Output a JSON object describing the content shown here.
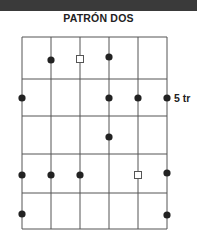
{
  "title": "PATRÓN DOS",
  "fret_label": "5 tr",
  "colors": {
    "line": "#555555",
    "dot": "#222222",
    "band": "#3a3a3a"
  },
  "grid": {
    "x": [
      22,
      51,
      80,
      109,
      138,
      167
    ],
    "y": [
      37,
      79,
      116,
      154,
      193,
      229
    ]
  },
  "markers": [
    {
      "type": "dot",
      "x": 51,
      "y": 60
    },
    {
      "type": "square",
      "x": 80,
      "y": 59
    },
    {
      "type": "dot",
      "x": 109,
      "y": 57
    },
    {
      "type": "dot",
      "x": 22,
      "y": 98
    },
    {
      "type": "dot",
      "x": 109,
      "y": 98
    },
    {
      "type": "dot",
      "x": 138,
      "y": 98
    },
    {
      "type": "dot",
      "x": 167,
      "y": 98
    },
    {
      "type": "dot",
      "x": 109,
      "y": 137
    },
    {
      "type": "dot",
      "x": 22,
      "y": 175
    },
    {
      "type": "dot",
      "x": 51,
      "y": 175
    },
    {
      "type": "dot",
      "x": 80,
      "y": 175
    },
    {
      "type": "square",
      "x": 138,
      "y": 175
    },
    {
      "type": "dot",
      "x": 167,
      "y": 173
    },
    {
      "type": "dot",
      "x": 22,
      "y": 214
    },
    {
      "type": "dot",
      "x": 167,
      "y": 215
    }
  ]
}
